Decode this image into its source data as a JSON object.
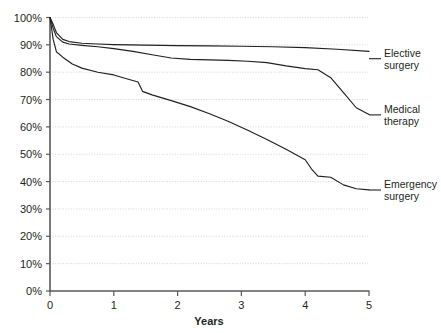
{
  "chart_data": {
    "type": "line",
    "title": "",
    "subtitle": "",
    "xlabel": "Years",
    "ylabel": "",
    "xlim": [
      0,
      5
    ],
    "ylim": [
      0,
      100
    ],
    "grid": true,
    "legend_position": "right-inline-labels",
    "x_ticks": [
      "0",
      "1",
      "2",
      "3",
      "4",
      "5"
    ],
    "x_tick_values": [
      0,
      1,
      2,
      3,
      4,
      5
    ],
    "y_ticks": [
      "0%",
      "10%",
      "20%",
      "30%",
      "40%",
      "50%",
      "60%",
      "70%",
      "80%",
      "90%",
      "100%"
    ],
    "y_tick_values": [
      0,
      10,
      20,
      30,
      40,
      50,
      60,
      70,
      80,
      90,
      100
    ],
    "series": [
      {
        "name": "Elective surgery",
        "label_lines": [
          "Elective",
          "surgery"
        ],
        "color": "#231f20",
        "x": [
          0,
          0.05,
          0.1,
          0.2,
          0.3,
          0.5,
          0.75,
          1.0,
          1.5,
          2.0,
          2.5,
          3.0,
          3.5,
          4.0,
          4.5,
          5.0
        ],
        "values": [
          100,
          97.5,
          94.5,
          92.0,
          91.2,
          90.6,
          90.3,
          90.1,
          89.9,
          89.7,
          89.6,
          89.5,
          89.3,
          89.0,
          88.4,
          87.6
        ],
        "end_value": 87.6
      },
      {
        "name": "Medical therapy",
        "label_lines": [
          "Medical",
          "therapy"
        ],
        "color": "#231f20",
        "x": [
          0,
          0.05,
          0.1,
          0.2,
          0.3,
          0.5,
          0.75,
          1.0,
          1.3,
          1.6,
          1.9,
          2.2,
          2.5,
          2.8,
          3.1,
          3.4,
          3.7,
          4.0,
          4.2,
          4.4,
          4.6,
          4.8,
          5.0
        ],
        "values": [
          100,
          96.0,
          93.0,
          91.0,
          90.3,
          89.8,
          89.3,
          88.6,
          87.6,
          86.4,
          85.2,
          84.7,
          84.5,
          84.3,
          84.0,
          83.5,
          82.3,
          81.3,
          80.9,
          78.0,
          72.5,
          67.0,
          64.5
        ],
        "end_value": 64.5
      },
      {
        "name": "Emergency surgery",
        "label_lines": [
          "Emergency",
          "surgery"
        ],
        "color": "#231f20",
        "x": [
          0,
          0.05,
          0.1,
          0.2,
          0.35,
          0.5,
          0.75,
          1.0,
          1.2,
          1.38,
          1.45,
          1.6,
          1.9,
          2.2,
          2.5,
          2.8,
          3.1,
          3.4,
          3.7,
          4.0,
          4.1,
          4.2,
          4.4,
          4.6,
          4.8,
          5.0
        ],
        "values": [
          100,
          92.0,
          87.5,
          85.5,
          83.0,
          81.5,
          80.0,
          79.0,
          77.6,
          76.4,
          73.0,
          71.7,
          69.6,
          67.4,
          64.8,
          62.0,
          58.8,
          55.4,
          51.8,
          48.0,
          44.6,
          42.0,
          41.6,
          38.8,
          37.4,
          37.0
        ],
        "end_value": 37.0
      }
    ]
  },
  "labels": {
    "elective_line1": "Elective",
    "elective_line2": "surgery",
    "medical_line1": "Medical",
    "medical_line2": "therapy",
    "emergency_line1": "Emergency",
    "emergency_line2": "surgery",
    "x_axis_title": "Years"
  },
  "colors": {
    "curve": "#231f20",
    "grid": "#c9c9c9",
    "axis": "#58595b",
    "text": "#231f20",
    "background": "#ffffff"
  }
}
